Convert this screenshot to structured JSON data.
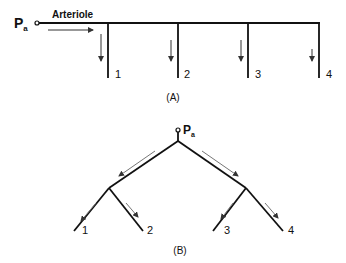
{
  "panel_a": {
    "source_label": "P",
    "source_sub": "a",
    "vessel_label": "Arteriole",
    "branch_labels": [
      "1",
      "2",
      "3",
      "4"
    ],
    "caption": "(A)"
  },
  "panel_b": {
    "source_label": "P",
    "source_sub": "a",
    "branch_labels": [
      "1",
      "2",
      "3",
      "4"
    ],
    "caption": "(B)"
  },
  "colors": {
    "line": "#111111",
    "arrow": "#555555"
  }
}
